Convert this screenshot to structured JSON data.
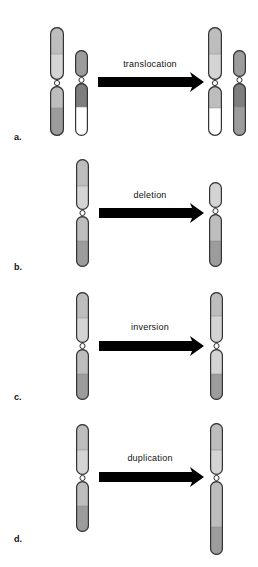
{
  "figure": {
    "colors": {
      "light": "#d4d4d4",
      "mid": "#bdbdbd",
      "dark": "#9c9c9c",
      "darker": "#7e7e7e",
      "white": "#ffffff",
      "outline": "#333333",
      "arrow": "#000000"
    },
    "panels": [
      {
        "id": "a",
        "label": "a.",
        "mutation": "translocation",
        "label_y": 140,
        "arrow": {
          "x1": 98,
          "x2": 204,
          "y": 82
        },
        "before": [
          {
            "x": 50,
            "w": 14,
            "top": 27,
            "cen": 80,
            "bottom": 136,
            "bands": [
              {
                "y1": 27,
                "y2": 54,
                "tone": "mid"
              },
              {
                "y1": 54,
                "y2": 80,
                "tone": "light"
              },
              {
                "y1": 86,
                "y2": 108,
                "tone": "mid"
              },
              {
                "y1": 108,
                "y2": 136,
                "tone": "dark"
              }
            ]
          },
          {
            "x": 75,
            "w": 13,
            "top": 50,
            "cen": 77,
            "bottom": 136,
            "bands": [
              {
                "y1": 50,
                "y2": 77,
                "tone": "dark"
              },
              {
                "y1": 83,
                "y2": 107,
                "tone": "darker"
              },
              {
                "y1": 107,
                "y2": 136,
                "tone": "white"
              }
            ]
          }
        ],
        "after": [
          {
            "x": 208,
            "w": 14,
            "top": 27,
            "cen": 80,
            "bottom": 136,
            "bands": [
              {
                "y1": 27,
                "y2": 54,
                "tone": "mid"
              },
              {
                "y1": 54,
                "y2": 80,
                "tone": "light"
              },
              {
                "y1": 86,
                "y2": 108,
                "tone": "mid"
              },
              {
                "y1": 108,
                "y2": 136,
                "tone": "white"
              }
            ]
          },
          {
            "x": 233,
            "w": 13,
            "top": 50,
            "cen": 77,
            "bottom": 136,
            "bands": [
              {
                "y1": 50,
                "y2": 77,
                "tone": "dark"
              },
              {
                "y1": 83,
                "y2": 107,
                "tone": "darker"
              },
              {
                "y1": 107,
                "y2": 136,
                "tone": "dark"
              }
            ]
          }
        ]
      },
      {
        "id": "b",
        "label": "b.",
        "mutation": "deletion",
        "label_y": 267,
        "arrow": {
          "x1": 99,
          "x2": 204,
          "y": 213
        },
        "before": [
          {
            "x": 76,
            "w": 13,
            "top": 159,
            "cen": 210,
            "bottom": 267,
            "bands": [
              {
                "y1": 159,
                "y2": 186,
                "tone": "mid"
              },
              {
                "y1": 186,
                "y2": 210,
                "tone": "light"
              },
              {
                "y1": 217,
                "y2": 241,
                "tone": "mid"
              },
              {
                "y1": 241,
                "y2": 267,
                "tone": "dark"
              }
            ]
          }
        ],
        "after": [
          {
            "x": 209,
            "w": 13,
            "top": 182,
            "cen": 208,
            "bottom": 267,
            "bands": [
              {
                "y1": 182,
                "y2": 208,
                "tone": "light"
              },
              {
                "y1": 214,
                "y2": 241,
                "tone": "mid"
              },
              {
                "y1": 241,
                "y2": 267,
                "tone": "dark"
              }
            ]
          }
        ]
      },
      {
        "id": "c",
        "label": "c.",
        "mutation": "inversion",
        "label_y": 398,
        "arrow": {
          "x1": 99,
          "x2": 204,
          "y": 346
        },
        "before": [
          {
            "x": 76,
            "w": 13,
            "top": 292,
            "cen": 343,
            "bottom": 400,
            "bands": [
              {
                "y1": 292,
                "y2": 318,
                "tone": "mid"
              },
              {
                "y1": 318,
                "y2": 343,
                "tone": "light"
              },
              {
                "y1": 350,
                "y2": 374,
                "tone": "mid"
              },
              {
                "y1": 374,
                "y2": 400,
                "tone": "dark"
              }
            ]
          }
        ],
        "after": [
          {
            "x": 210,
            "w": 13,
            "top": 292,
            "cen": 343,
            "bottom": 400,
            "bands": [
              {
                "y1": 292,
                "y2": 316,
                "tone": "mid"
              },
              {
                "y1": 316,
                "y2": 343,
                "tone": "light"
              },
              {
                "y1": 350,
                "y2": 374,
                "tone": "light"
              },
              {
                "y1": 374,
                "y2": 400,
                "tone": "dark"
              }
            ]
          }
        ]
      },
      {
        "id": "d",
        "label": "d.",
        "mutation": "duplication",
        "label_y": 540,
        "arrow": {
          "x1": 99,
          "x2": 204,
          "y": 477
        },
        "before": [
          {
            "x": 76,
            "w": 13,
            "top": 424,
            "cen": 475,
            "bottom": 532,
            "bands": [
              {
                "y1": 424,
                "y2": 450,
                "tone": "mid"
              },
              {
                "y1": 450,
                "y2": 475,
                "tone": "light"
              },
              {
                "y1": 482,
                "y2": 506,
                "tone": "mid"
              },
              {
                "y1": 506,
                "y2": 532,
                "tone": "dark"
              }
            ]
          }
        ],
        "after": [
          {
            "x": 210,
            "w": 13,
            "top": 423,
            "cen": 475,
            "bottom": 555,
            "bands": [
              {
                "y1": 423,
                "y2": 450,
                "tone": "mid"
              },
              {
                "y1": 450,
                "y2": 475,
                "tone": "light"
              },
              {
                "y1": 482,
                "y2": 527,
                "tone": "mid"
              },
              {
                "y1": 527,
                "y2": 555,
                "tone": "dark"
              }
            ]
          }
        ]
      }
    ]
  }
}
